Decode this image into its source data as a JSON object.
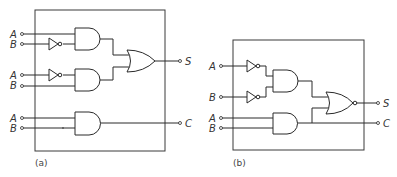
{
  "diagram": {
    "type": "logic-circuit",
    "panels": [
      {
        "caption": "(a)",
        "inputs": [
          {
            "label": "A"
          },
          {
            "label": "B"
          },
          {
            "label": "A"
          },
          {
            "label": "B"
          },
          {
            "label": "A"
          },
          {
            "label": "B"
          }
        ],
        "outputs": [
          {
            "label": "S"
          },
          {
            "label": "C"
          }
        ],
        "gates": [
          "NOT",
          "AND",
          "NOT",
          "AND",
          "OR",
          "AND"
        ]
      },
      {
        "caption": "(b)",
        "inputs": [
          {
            "label": "A"
          },
          {
            "label": "B"
          },
          {
            "label": "A"
          },
          {
            "label": "B"
          }
        ],
        "outputs": [
          {
            "label": "S"
          },
          {
            "label": "C"
          }
        ],
        "gates": [
          "NOT",
          "NOT",
          "AND",
          "AND",
          "NOR"
        ]
      }
    ]
  },
  "colors": {
    "line": "#2a2a2a",
    "background": "#ffffff"
  }
}
